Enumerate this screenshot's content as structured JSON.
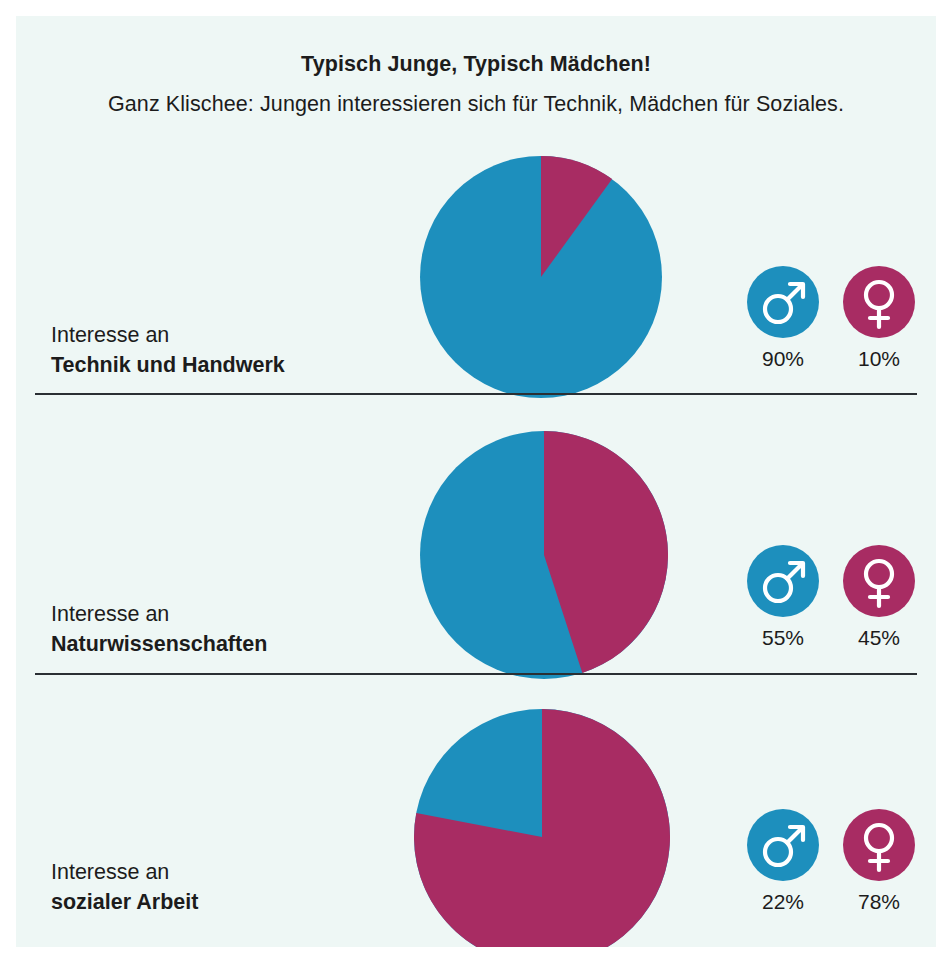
{
  "header": {
    "title": "Typisch Junge, Typisch Mädchen!",
    "subtitle": "Ganz Klischee: Jungen interessieren sich für Technik, Mädchen für Soziales."
  },
  "colors": {
    "background": "#eef7f5",
    "male_blue": "#1d8fbd",
    "female_magenta": "#a82c63",
    "text": "#1c1c1c",
    "divider": "#2a2f33"
  },
  "legend": {
    "male_icon": "mars-symbol",
    "female_icon": "venus-symbol"
  },
  "rows": [
    {
      "label_line1": "Interesse an",
      "label_line2": "Technik und Handwerk",
      "male_pct": "90%",
      "female_pct": "10%",
      "male_value": 90,
      "female_value": 10
    },
    {
      "label_line1": "Interesse an",
      "label_line2": "Naturwissenschaften",
      "male_pct": "55%",
      "female_pct": "45%",
      "male_value": 55,
      "female_value": 45
    },
    {
      "label_line1": "Interesse an",
      "label_line2": "sozialer Arbeit",
      "male_pct": "22%",
      "female_pct": "78%",
      "male_value": 22,
      "female_value": 78
    }
  ],
  "chart_data": {
    "type": "pie",
    "title": "Typisch Junge, Typisch Mädchen!",
    "subtitle": "Ganz Klischee: Jungen interessieren sich für Technik, Mädchen für Soziales.",
    "legend": [
      "Jungen",
      "Mädchen"
    ],
    "legend_position": "right",
    "units": "percent",
    "charts": [
      {
        "name": "Interesse an Technik und Handwerk",
        "labels": [
          "Jungen",
          "Mädchen"
        ],
        "values": [
          90,
          10
        ],
        "colors": [
          "#1d8fbd",
          "#a82c63"
        ],
        "start_angle_deg": 0,
        "direction": "clockwise",
        "note": "Mädchen-Segment beginnt bei 12 Uhr im Uhrzeigersinn"
      },
      {
        "name": "Interesse an Naturwissenschaften",
        "labels": [
          "Jungen",
          "Mädchen"
        ],
        "values": [
          55,
          45
        ],
        "colors": [
          "#1d8fbd",
          "#a82c63"
        ],
        "start_angle_deg": 0,
        "direction": "clockwise",
        "note": "Mädchen-Segment beginnt bei 12 Uhr im Uhrzeigersinn"
      },
      {
        "name": "Interesse an sozialer Arbeit",
        "labels": [
          "Jungen",
          "Mädchen"
        ],
        "values": [
          22,
          78
        ],
        "colors": [
          "#1d8fbd",
          "#a82c63"
        ],
        "start_angle_deg": 0,
        "direction": "clockwise",
        "note": "Mädchen-Segment beginnt bei 12 Uhr im Uhrzeigersinn"
      }
    ]
  }
}
